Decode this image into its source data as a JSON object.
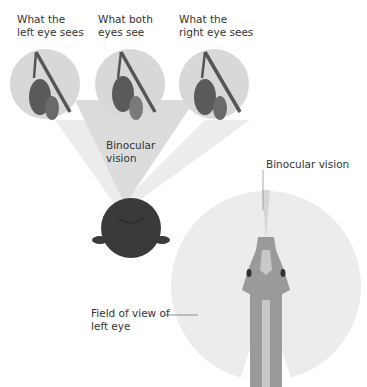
{
  "labels": {
    "left_eye": "What the\nleft eye sees",
    "both_eyes": "What both\neyes see",
    "right_eye": "What the\nright eye sees",
    "binocular_left": "Binocular\nvision",
    "binocular_right": "Binocular vision",
    "field_left": "Field of view of\nleft eye"
  },
  "colors": {
    "circle_bg": "#d8d8d8",
    "fruit_dark": "#5a5a5a",
    "fruit_light": "#777777",
    "branch": "#555555",
    "cone_light": "#ececec",
    "cone_mid": "#dcdcdc",
    "head_dark": "#3a3a3a",
    "field_bg": "#ededed",
    "bird_body": "#9a9a9a",
    "bird_light": "#c8c8c8"
  }
}
